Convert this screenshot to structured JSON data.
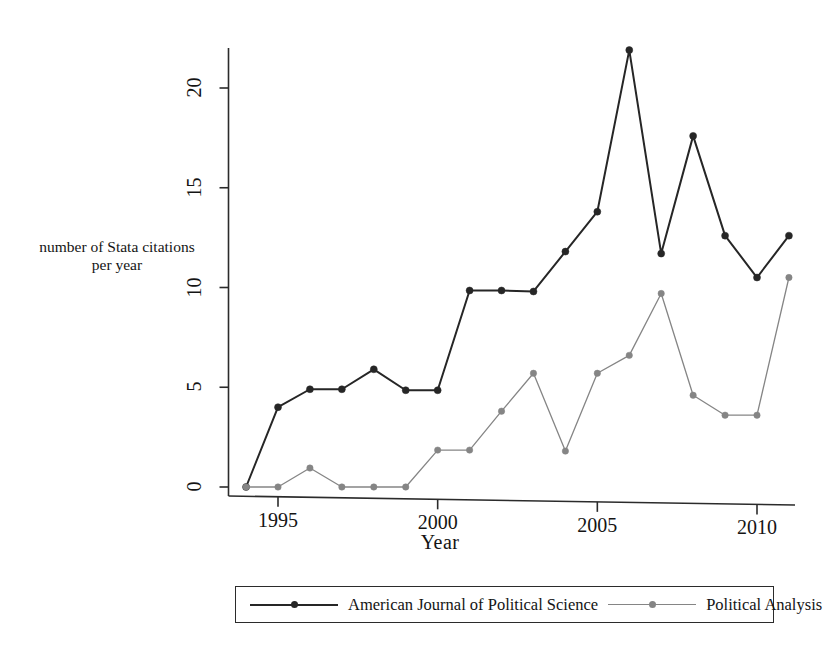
{
  "chart_data": {
    "type": "line",
    "title": "",
    "subtitle": "",
    "xlabel": "Year",
    "ylabel": "number of Stata citations per year",
    "ylabel_lines": [
      "number of Stata citations",
      "per year"
    ],
    "x": [
      1994,
      1995,
      1996,
      1997,
      1998,
      1999,
      2000,
      2001,
      2002,
      2003,
      2004,
      2005,
      2006,
      2007,
      2008,
      2009,
      2010,
      2011
    ],
    "xlim": [
      1993.6,
      2011.4
    ],
    "ylim": [
      0,
      22.5
    ],
    "xticks": [
      1995,
      2000,
      2005,
      2010
    ],
    "xtick_labels": [
      "1995",
      "2000",
      "2005",
      "2010"
    ],
    "yticks": [
      0,
      5,
      10,
      15,
      20
    ],
    "ytick_labels": [
      "0",
      "5",
      "10",
      "15",
      "20"
    ],
    "grid": false,
    "legend_position": "bottom",
    "markers": "filled-circle",
    "series": [
      {
        "name": "American Journal of Political Science",
        "color": "#262626",
        "values": [
          0,
          4.0,
          4.9,
          4.9,
          5.9,
          4.85,
          4.85,
          9.85,
          9.85,
          9.8,
          11.8,
          13.8,
          21.9,
          11.7,
          17.6,
          12.6,
          10.5,
          12.6
        ]
      },
      {
        "name": "Political Analysis",
        "color": "#858585",
        "values": [
          0,
          0,
          0.95,
          0,
          0,
          0,
          1.85,
          1.85,
          3.8,
          5.7,
          1.8,
          5.7,
          6.6,
          9.7,
          4.6,
          3.6,
          3.6,
          10.5
        ]
      }
    ]
  },
  "axes": {
    "axis_color": "#2b2b2b"
  },
  "legend": {
    "entries": [
      {
        "label": "American Journal of Political Science",
        "color": "#262626"
      },
      {
        "label": "Political Analysis",
        "color": "#858585"
      }
    ]
  }
}
